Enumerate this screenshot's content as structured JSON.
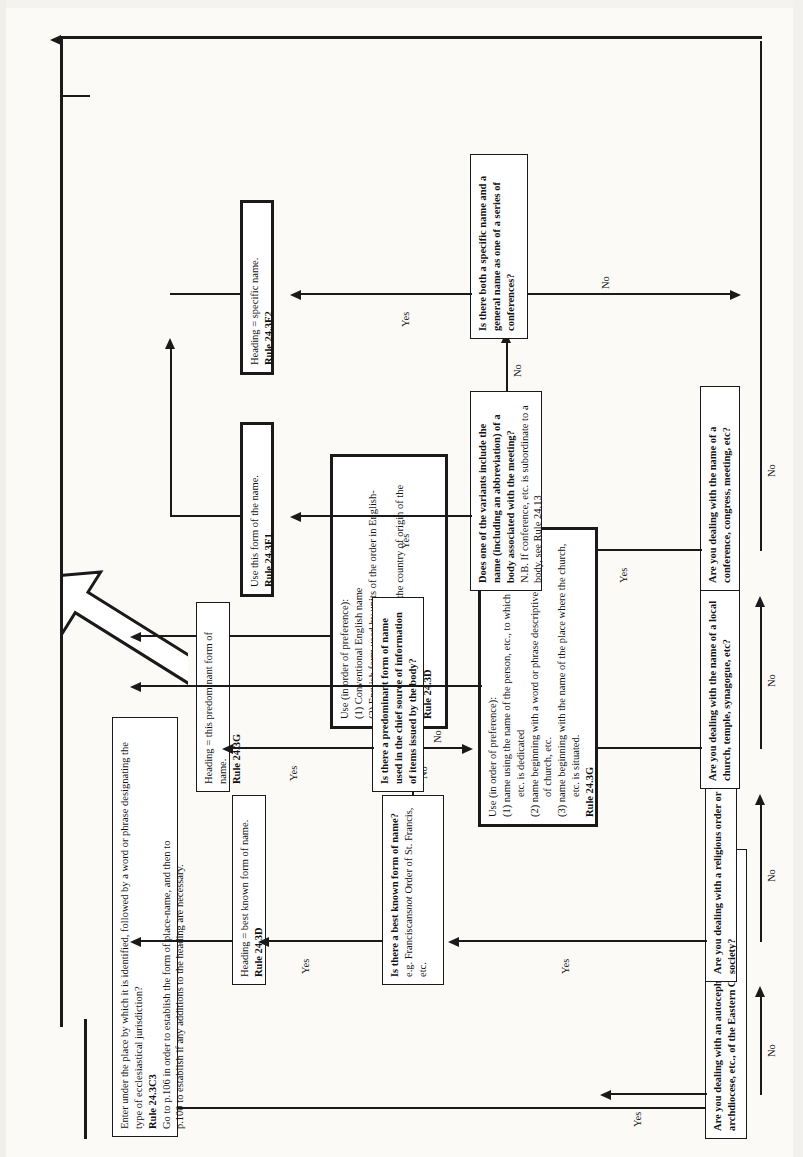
{
  "diagram": {
    "orientation": "rotated-90-counterclockwise",
    "edge_labels": {
      "yes": "Yes",
      "no": "No"
    },
    "questions": [
      {
        "id": "q-eastern-church",
        "text": "Are you dealing with an autocephalous patriarchate, archdiocese, etc., of the Eastern Church?"
      },
      {
        "id": "q-religious-order",
        "text": "Are you dealing with a religious order or society?"
      },
      {
        "id": "q-local-church",
        "text": "Are you dealing with the name of a local church, temple, synagogue, etc?"
      },
      {
        "id": "q-conference",
        "text": "Are you dealing with the name of a conference, congress, meeting, etc?"
      }
    ],
    "decisions": [
      {
        "id": "d-best-known",
        "heading": "Is there a best known form of name?",
        "example": "e.g. Franciscans",
        "example_italic": "not",
        "example_tail": " Order of St. Francis, etc."
      },
      {
        "id": "d-predominant",
        "text": "Is there a predominant form of name used in the chief source of information of items issued by the body?"
      },
      {
        "id": "d-variants",
        "text": "Does one of the variants include the name (including an abbreviation) of a body associated with the meeting?",
        "note": "N.B. If conference, etc. is subordinate to a body, see Rule 24.13"
      },
      {
        "id": "d-specific-general",
        "text": "Is there both a specific name and a general name as one of a series of conferences?"
      }
    ],
    "actions": [
      {
        "id": "a-enter-under-place",
        "text": "Enter under the place by which it is identified, followed by a word or phrase designating the type of ecclesiastical jurisdiction?",
        "rule": "Rule 24.3C3",
        "note1": "Go to p.106 in order to establish the form of place-name, and then to",
        "note2": "p.100 to establish if any additions to the heading are necessary."
      },
      {
        "id": "a-heading-best-known",
        "text": "Heading = best known form of name.",
        "rule": "Rule 24.3D"
      },
      {
        "id": "a-use-order-pref-order",
        "lead": "Use (in order of preference):",
        "items": [
          "(1)  Conventional English name",
          "(2)  English form used by units of the order in English-speaking countries",
          "(3)  Name in the language of the country of origin of the order or society"
        ],
        "rule": "Rule 24.3D"
      },
      {
        "id": "a-heading-predominant",
        "text": "Heading = this predominant form of name.",
        "rule": "Rule 24.3G"
      },
      {
        "id": "a-use-order-pref-church",
        "lead": "Use (in order of preference):",
        "items": [
          "(1)  name using the name of the person, etc., to which the church, etc. is dedicated",
          "(2)  name beginning with a word or phrase descriptive of the type of church, etc.",
          "(3)  name beginning with the name of the place where the church, etc. is situated."
        ],
        "rule": "Rule 24.3G"
      },
      {
        "id": "a-use-this-form",
        "text": "Use this form of the name.",
        "rule": "Rule 24.3F1"
      },
      {
        "id": "a-heading-specific",
        "text": "Heading = specific name.",
        "rule": "Rule 24.3F2"
      }
    ],
    "colors": {
      "ink": "#1a1a1a",
      "paper": "#fbfaf7",
      "box_fill": "#ffffff"
    }
  }
}
